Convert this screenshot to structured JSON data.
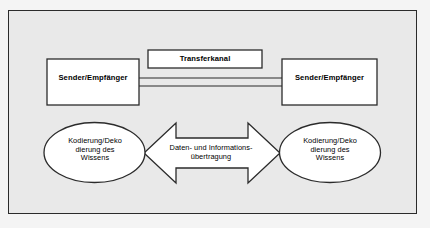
{
  "diagram": {
    "background_color": "#e9e9e9",
    "border_color": "#2b2b2b",
    "shape_fill": "#ffffff",
    "frame": {
      "x": 8,
      "y": 10,
      "width": 409,
      "height": 204
    },
    "nodes": {
      "transferkanal": {
        "label": "Transferkanal",
        "shape": "rectangle",
        "x": 148,
        "y": 50,
        "width": 114,
        "height": 18
      },
      "sender_left": {
        "label": "Sender/Empfänger",
        "shape": "rectangle",
        "x": 47,
        "y": 59,
        "width": 92,
        "height": 46
      },
      "sender_right": {
        "label": "Sender/Empfänger",
        "shape": "rectangle",
        "x": 282,
        "y": 59,
        "width": 95,
        "height": 46
      },
      "ellipse_left": {
        "label": "Kodierung/Deko\ndierung des\nWissens",
        "shape": "ellipse",
        "cx": 94.5,
        "cy": 152.5,
        "rx": 50.5,
        "ry": 30
      },
      "ellipse_right": {
        "label": "Kodierung/Deko\ndierung des\nWissens",
        "shape": "ellipse",
        "cx": 330,
        "cy": 152.5,
        "rx": 50.5,
        "ry": 30
      },
      "arrow": {
        "label": "Daten- und Informations-\nübertragung",
        "shape": "double-headed-arrow",
        "x": 144,
        "y": 123,
        "width": 136,
        "height": 60
      }
    },
    "connectors": [
      {
        "name": "transfer-line-upper",
        "from": "sender_left",
        "to": "sender_right",
        "y": 78
      },
      {
        "name": "transfer-line-lower",
        "from": "sender_left",
        "to": "sender_right",
        "y": 86
      }
    ]
  }
}
